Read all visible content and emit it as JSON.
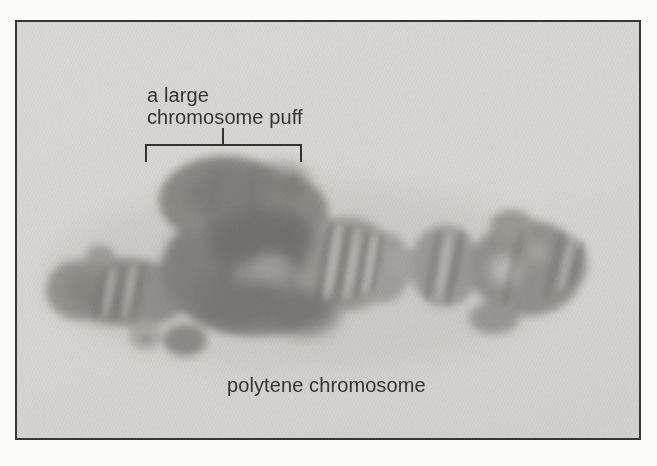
{
  "figure": {
    "kind": "light micrograph",
    "annotations": {
      "puff_label": "a large\nchromosome puff",
      "caption": "polytene chromosome"
    }
  },
  "colors": {
    "page_background": "#fbfbf8",
    "frame_border": "#363634",
    "photo_background": "#d7d6d2",
    "annotation_ink": "#333331",
    "chromosome_base": "#8f8d89",
    "chromosome_dark": "#6e6c69",
    "chromosome_light_band": "#c9c8c4"
  }
}
